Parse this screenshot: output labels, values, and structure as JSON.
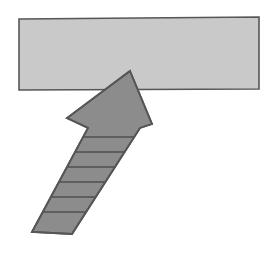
{
  "figure": {
    "title": "Upward arrow pointing into a horizontal bar",
    "canvas": {
      "width": 274,
      "height": 253,
      "background": "#ffffff"
    },
    "palette": {
      "bar_fill": "#c9c9c9",
      "arrow_fill": "#8c8c8c",
      "outline": "#565656",
      "stripe": "#4f4f4f",
      "background": "#ffffff"
    },
    "shapes": [
      {
        "name": "horizontal-bar",
        "kind": "rectangle",
        "label": "Bar",
        "fill": "#c9c9c9",
        "stroke": "#565656",
        "stroke_width": 1.6,
        "x": 19,
        "y": 18,
        "width": 240,
        "height": 72,
        "points": "19,19 259,17 259,89 19,90"
      },
      {
        "name": "upward-arrow",
        "kind": "polygon",
        "label": "Arrow",
        "fill": "#8c8c8c",
        "stroke": "#565656",
        "stroke_width": 1.8,
        "direction": "up-right",
        "tip": [
          130,
          71
        ],
        "points": "130,71 152,124 140,128 72,234 32,232 88,128 67,118"
      }
    ],
    "stripes": {
      "name": "arrow-shaft-stripes",
      "count": 6,
      "color": "#4f4f4f",
      "width": 1.6,
      "segments": 7,
      "lines": [
        {
          "x1": 84,
          "y1": 137,
          "x2": 137,
          "y2": 137
        },
        {
          "x1": 75,
          "y1": 152,
          "x2": 131,
          "y2": 152
        },
        {
          "x1": 66,
          "y1": 167,
          "x2": 124,
          "y2": 167
        },
        {
          "x1": 57,
          "y1": 182,
          "x2": 118,
          "y2": 182
        },
        {
          "x1": 48,
          "y1": 197,
          "x2": 112,
          "y2": 197
        },
        {
          "x1": 39,
          "y1": 212,
          "x2": 105,
          "y2": 212
        }
      ]
    }
  }
}
